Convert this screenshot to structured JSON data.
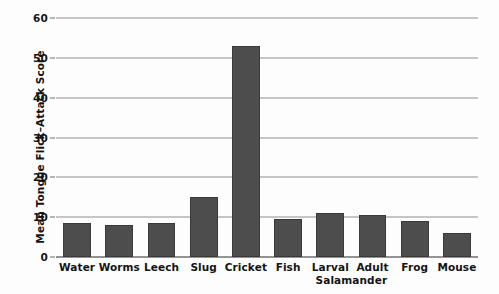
{
  "chart_data": {
    "type": "bar",
    "title": "",
    "xlabel": "",
    "ylabel": "Mean Tongue Flick–Attack Score",
    "categories": [
      "Water",
      "Worms",
      "Leech",
      "Slug",
      "Cricket",
      "Fish",
      "Larval",
      "Adult",
      "Frog",
      "Mouse"
    ],
    "values": [
      8.5,
      8,
      8.5,
      15,
      53,
      9.5,
      11,
      10.5,
      9,
      6
    ],
    "group_labels": [
      {
        "text": "Salamander",
        "spans": [
          "Larval",
          "Adult"
        ]
      }
    ],
    "ylim": [
      0,
      60
    ],
    "yticks": [
      0,
      10,
      20,
      30,
      40,
      50,
      60
    ],
    "ytick_labels": [
      "0",
      "10",
      "20",
      "30",
      "40",
      "50",
      "60"
    ],
    "grid": true,
    "legend": "none",
    "bar_color": "#4d4d4d",
    "bar_edge_color": "#3a3a3a",
    "gridline_color": "#8e8e8e",
    "axis_color": "#2a2a2a",
    "background_color": "#fdfdfd"
  }
}
